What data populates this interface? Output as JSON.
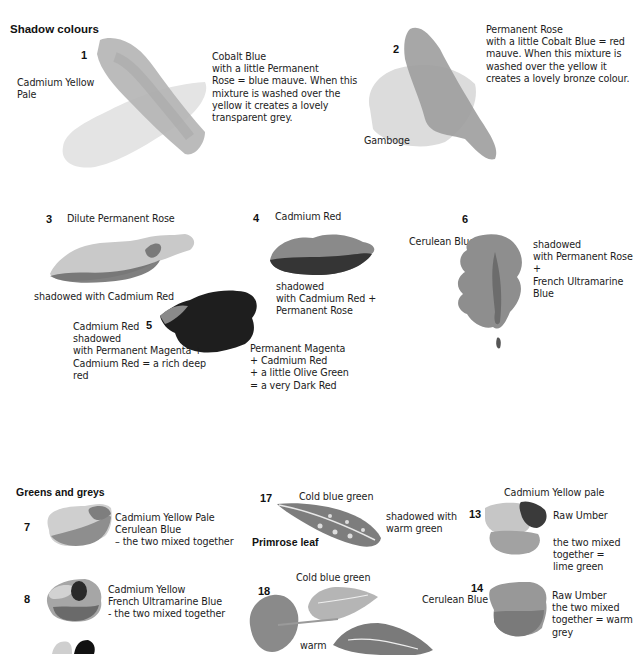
{
  "sections": {
    "shadow": {
      "title": "Shadow colours"
    },
    "greens": {
      "title": "Greens and greys"
    }
  },
  "swatches": {
    "s1": {
      "number": "1",
      "base_label": "Cadmium Yellow\nPale",
      "caption": "Cobalt Blue\nwith a little Permanent\nRose =  blue mauve. When this\nmixture is washed over the\nyellow it creates a lovely\ntransparent grey."
    },
    "s2": {
      "number": "2",
      "base_label": "Gamboge",
      "caption": "Permanent Rose\nwith a little Cobalt Blue = red\nmauve. When this mixture is\nwashed over the yellow it\ncreates a lovely bronze colour."
    },
    "s3": {
      "number": "3",
      "top_label": "Dilute Permanent Rose",
      "caption": "shadowed with Cadmium Red"
    },
    "s4": {
      "number": "4",
      "top_label": "Cadmium Red",
      "caption": "shadowed\nwith Cadmium Red +\nPermanent Rose"
    },
    "s5": {
      "number": "5",
      "left_caption": "Cadmium Red\nshadowed\nwith Permanent Magenta +\nCadmium Red = a rich deep\nred",
      "right_caption": "Permanent Magenta\n+ Cadmium Red\n+ a little Olive Green\n= a very Dark Red"
    },
    "s6": {
      "number": "6",
      "base_label": "Cerulean Blue",
      "caption": "shadowed\nwith Permanent Rose +\nFrench Ultramarine\nBlue"
    },
    "s7": {
      "number": "7",
      "caption": "Cadmium Yellow Pale\nCerulean Blue\n– the two mixed together"
    },
    "s8": {
      "number": "8",
      "caption": "Cadmium Yellow\nFrench  Ultramarine Blue\n- the two mixed together"
    },
    "s13": {
      "number": "13",
      "top_label": "Cadmium Yellow pale",
      "side_label": "Raw Umber",
      "caption": "the two mixed\ntogether =\nlime green"
    },
    "s14": {
      "number": "14",
      "base_label": "Cerulean Blue",
      "caption": "Raw Umber\nthe  two mixed\ntogether  = warm\ngrey"
    },
    "s17": {
      "number": "17",
      "top_label": "Cold blue green",
      "leaf_label": "Primrose leaf",
      "caption": "shadowed with\nwarm green"
    },
    "s18": {
      "number": "18",
      "top_label": "Cold blue green",
      "bottom_label": "warm"
    }
  },
  "colors": {
    "text": "#1c1c1c",
    "light_wash": "#d6d6d6",
    "mid_wash": "#a8a8a8",
    "dark_wash": "#3c3c3c"
  }
}
